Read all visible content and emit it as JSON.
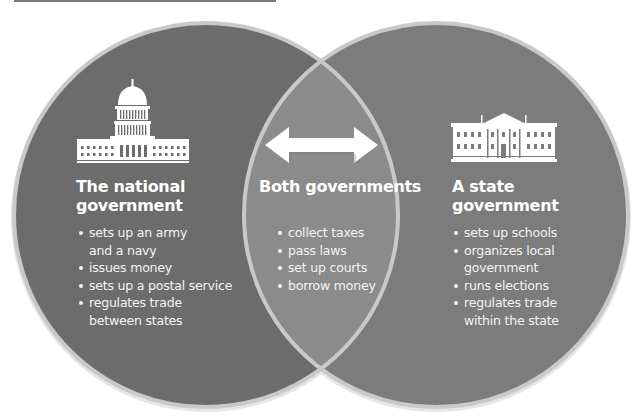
{
  "colors": {
    "national_fill": "#6c6c6c",
    "state_fill": "#7c7c7c",
    "overlap_fill": "#8b8b8b",
    "ring": "#c9c9c9",
    "text": "#ffffff"
  },
  "national": {
    "icon": "capitol-building-icon",
    "title_line1": "The national",
    "title_line2": "government",
    "items": [
      "sets up an army and a navy",
      "issues money",
      "sets up a postal service",
      "regulates trade between states"
    ],
    "items_display": [
      [
        "sets up an army",
        "and a navy"
      ],
      [
        "issues money"
      ],
      [
        "sets up a postal service"
      ],
      [
        "regulates trade",
        "between states"
      ]
    ]
  },
  "both": {
    "icon": "double-arrow-icon",
    "title": "Both governments",
    "items": [
      "collect taxes",
      "pass laws",
      "set up courts",
      "borrow money"
    ]
  },
  "state": {
    "icon": "white-house-building-icon",
    "title_line1": "A state",
    "title_line2": "government",
    "items": [
      "sets up schools",
      "organizes local government",
      "runs elections",
      "regulates trade within the state"
    ],
    "items_display": [
      [
        "sets up schools"
      ],
      [
        "organizes local",
        "government"
      ],
      [
        "runs elections"
      ],
      [
        "regulates trade",
        "within the state"
      ]
    ]
  }
}
